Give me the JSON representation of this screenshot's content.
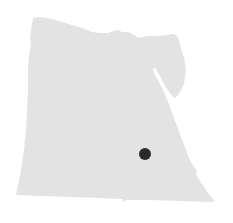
{
  "map": {
    "country": "Egypt",
    "fill_color": "#e3e3e3",
    "background_color": "#ffffff",
    "markers": [
      {
        "x": 145,
        "y": 154,
        "radius": 6,
        "color": "#2b2b2b"
      }
    ]
  }
}
